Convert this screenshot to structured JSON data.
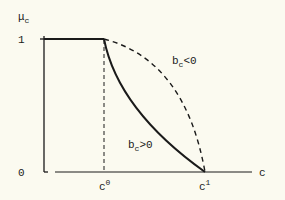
{
  "diagram": {
    "type": "function-plot",
    "y_axis": {
      "label": "μ",
      "label_subscript": "c",
      "ticks": [
        {
          "label": "1",
          "value": 1
        },
        {
          "label": "0",
          "value": 0
        }
      ]
    },
    "x_axis": {
      "label": "c",
      "ticks": [
        {
          "label": "c",
          "superscript": "0"
        },
        {
          "label": "c",
          "superscript": "1"
        }
      ]
    },
    "curves": [
      {
        "name": "flat-segment",
        "style": "solid",
        "description": "μc = 1 from 0 to c0"
      },
      {
        "name": "convex-curve",
        "style": "solid",
        "label": "b",
        "label_subscript": "c",
        "label_suffix": ">0"
      },
      {
        "name": "concave-curve",
        "style": "dashed",
        "label": "b",
        "label_subscript": "c",
        "label_suffix": "<0"
      },
      {
        "name": "c0-guide",
        "style": "dashed",
        "description": "vertical line at c0"
      }
    ],
    "colors": {
      "background": "#fbfaf0",
      "ink": "#1a1a1a"
    }
  }
}
